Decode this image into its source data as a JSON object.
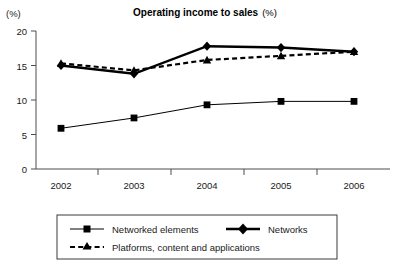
{
  "chart_data": {
    "type": "line",
    "title": "Operating income to sales",
    "title_unit": "(%)",
    "ylabel": "(%)",
    "xlabel": "",
    "categories": [
      "2002",
      "2003",
      "2004",
      "2005",
      "2006"
    ],
    "yticks": [
      0,
      5,
      10,
      15,
      20
    ],
    "ylim": [
      0,
      20
    ],
    "grid": false,
    "legend_position": "bottom",
    "series": [
      {
        "name": "Networked elements",
        "marker": "square",
        "line_style": "thin-solid",
        "values": [
          5.9,
          7.4,
          9.3,
          9.8,
          9.8
        ]
      },
      {
        "name": "Networks",
        "marker": "diamond",
        "line_style": "thick-solid",
        "values": [
          15.0,
          13.8,
          17.8,
          17.6,
          17.0
        ]
      },
      {
        "name": "Platforms, content and applications",
        "marker": "triangle",
        "line_style": "dashed",
        "values": [
          15.3,
          14.3,
          15.8,
          16.4,
          17.0
        ]
      }
    ]
  },
  "legend": {
    "entries": [
      {
        "label": "Networked elements"
      },
      {
        "label": "Networks"
      },
      {
        "label": "Platforms, content and applications"
      }
    ]
  },
  "colors": {
    "ink": "#000000",
    "axis": "#4d4d4d",
    "background": "#ffffff"
  }
}
